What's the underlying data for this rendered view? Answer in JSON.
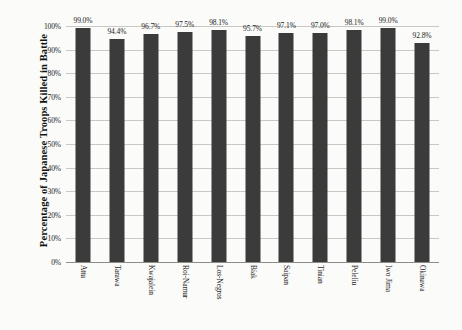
{
  "chart_data": {
    "type": "bar",
    "title": "",
    "xlabel": "",
    "ylabel": "Percentage of Japanese Troops Killed in Battle",
    "ylim": [
      0,
      100
    ],
    "grid": true,
    "legend": false,
    "bar_color": "#3b3b3b",
    "background_color": "#fbfbf9",
    "value_suffix": "%",
    "categories": [
      "Attu",
      "Tarawa",
      "Kwajalein",
      "Roi-Namur",
      "Los-Negros",
      "Biak",
      "Saipan",
      "Tinian",
      "Peleliu",
      "Iwo Jima",
      "Okinawa"
    ],
    "values": [
      99.0,
      94.4,
      96.7,
      97.5,
      98.1,
      95.7,
      97.1,
      97.0,
      98.1,
      99.0,
      92.8
    ],
    "value_labels": [
      "99.0%",
      "94.4%",
      "96.7%",
      "97.5%",
      "98.1%",
      "95.7%",
      "97.1%",
      "97.0%",
      "98.1%",
      "99.0%",
      "92.8%"
    ],
    "y_ticks": [
      0,
      10,
      20,
      30,
      40,
      50,
      60,
      70,
      80,
      90,
      100
    ],
    "y_tick_labels": [
      "0%",
      "10%",
      "20%",
      "30%",
      "40%",
      "50%",
      "60%",
      "70%",
      "80%",
      "90%",
      "100%"
    ]
  }
}
